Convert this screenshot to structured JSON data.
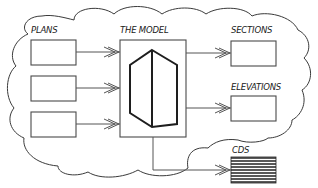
{
  "diagram": {
    "type": "flow",
    "container": {
      "shape": "cloud"
    },
    "labels": {
      "plans": "PLANS",
      "model": "THE MODEL",
      "sections": "SECTIONS",
      "elevations": "ELEVATIONS",
      "cds": "CDS"
    },
    "nodes": [
      {
        "id": "plan-1",
        "group": "PLANS",
        "shape": "rectangle"
      },
      {
        "id": "plan-2",
        "group": "PLANS",
        "shape": "rectangle"
      },
      {
        "id": "plan-3",
        "group": "PLANS",
        "shape": "rectangle"
      },
      {
        "id": "model",
        "label": "THE MODEL",
        "shape": "rectangle",
        "contains": "hexagonal-prism-icon"
      },
      {
        "id": "sections",
        "label": "SECTIONS",
        "shape": "rectangle"
      },
      {
        "id": "elevations",
        "label": "ELEVATIONS",
        "shape": "rectangle"
      },
      {
        "id": "cds",
        "label": "CDS",
        "shape": "striped-rectangle",
        "outside_cloud": true
      }
    ],
    "edges": [
      {
        "from": "plan-1",
        "to": "model"
      },
      {
        "from": "plan-2",
        "to": "model"
      },
      {
        "from": "plan-3",
        "to": "model"
      },
      {
        "from": "model",
        "to": "sections"
      },
      {
        "from": "model",
        "to": "elevations"
      },
      {
        "from": "model",
        "to": "cds"
      }
    ],
    "colors": {
      "stroke": "#3a3a3a",
      "hexagon": "#1e1e1e",
      "background": "#ffffff"
    }
  }
}
